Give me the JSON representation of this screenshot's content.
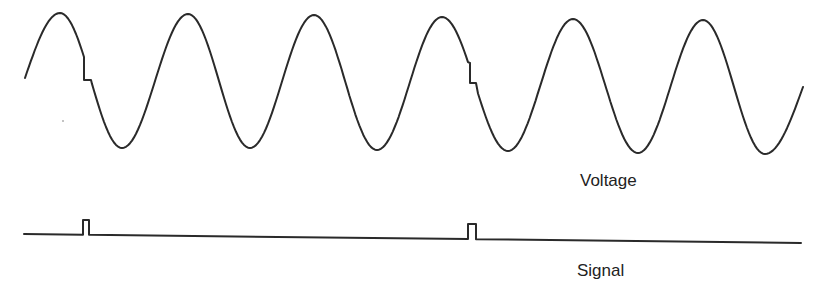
{
  "labels": {
    "voltage": "Voltage",
    "signal": "Signal"
  },
  "colors": {
    "stroke": "#2a2a2a",
    "text": "#222222",
    "background": "#ffffff"
  },
  "voltage_wave": {
    "start": [
      25,
      78
    ],
    "extrema": [
      [
        60,
        13
      ],
      [
        122,
        148
      ],
      [
        188,
        14
      ],
      [
        250,
        148
      ],
      [
        314,
        15
      ],
      [
        377,
        150
      ],
      [
        442,
        17
      ],
      [
        508,
        151
      ],
      [
        573,
        19
      ],
      [
        638,
        153
      ],
      [
        703,
        20
      ],
      [
        765,
        154
      ]
    ],
    "end": [
      803,
      87
    ],
    "glitches": [
      {
        "x": 84,
        "y_from": 57,
        "y_to": 80,
        "x_to": 91
      },
      {
        "x": 470,
        "y_from": 63,
        "y_to": 83,
        "x_to": 476
      }
    ]
  },
  "signal_trace": {
    "start": [
      24,
      234
    ],
    "end": [
      801,
      243
    ],
    "pulses": [
      {
        "x1": 83,
        "x2": 89,
        "top": 220
      },
      {
        "x1": 468,
        "x2": 476,
        "top": 224
      }
    ]
  }
}
